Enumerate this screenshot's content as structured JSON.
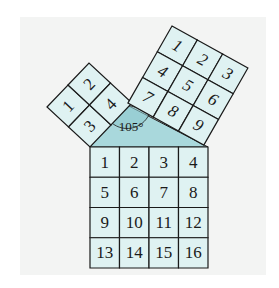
{
  "figure": {
    "angle_label": "105°",
    "left_square": {
      "grid": 2,
      "cells": [
        "1",
        "2",
        "3",
        "4"
      ]
    },
    "right_square": {
      "grid": 3,
      "cells": [
        "1",
        "2",
        "3",
        "4",
        "5",
        "6",
        "7",
        "8",
        "9"
      ]
    },
    "bottom_square": {
      "grid": 4,
      "cells": [
        "1",
        "2",
        "3",
        "4",
        "5",
        "6",
        "7",
        "8",
        "9",
        "10",
        "11",
        "12",
        "13",
        "14",
        "15",
        "16"
      ]
    },
    "colors": {
      "cell_fill": "#dff2f2",
      "triangle_fill": "#a9d8dc",
      "line": "#1a1a1a",
      "panel": "#f3f4f3"
    }
  }
}
